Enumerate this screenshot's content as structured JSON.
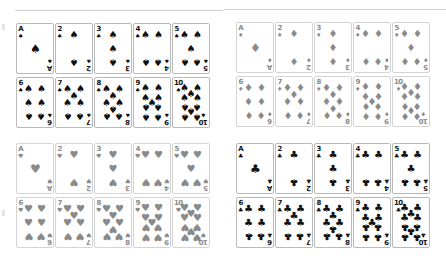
{
  "colors": {
    "black_suit": "#111111",
    "red_suit": "#8a8a8a",
    "rule": "#cfcfcf"
  },
  "suits": {
    "spades": {
      "glyph": "♠",
      "color": "black_suit",
      "icon": "spade-icon"
    },
    "diamonds": {
      "glyph": "♦",
      "color": "red_suit",
      "icon": "diamond-icon"
    },
    "hearts": {
      "glyph": "♥",
      "color": "red_suit",
      "icon": "heart-icon"
    },
    "clubs": {
      "glyph": "♣",
      "color": "black_suit",
      "icon": "club-icon"
    }
  },
  "panels": [
    {
      "name": "spades-panel",
      "suit": "spades",
      "x": 16,
      "y": 23,
      "ranks": [
        "A",
        "2",
        "3",
        "4",
        "5",
        "6",
        "7",
        "8",
        "9",
        "10"
      ]
    },
    {
      "name": "diamonds-panel",
      "suit": "diamonds",
      "x": 236,
      "y": 22,
      "ranks": [
        "A",
        "2",
        "3",
        "4",
        "5",
        "6",
        "7",
        "8",
        "9",
        "10"
      ]
    },
    {
      "name": "hearts-panel",
      "suit": "hearts",
      "x": 16,
      "y": 143,
      "ranks": [
        "A",
        "2",
        "3",
        "4",
        "5",
        "6",
        "7",
        "8",
        "9",
        "10"
      ]
    },
    {
      "name": "clubs-panel",
      "suit": "clubs",
      "x": 236,
      "y": 143,
      "ranks": [
        "A",
        "2",
        "3",
        "4",
        "5",
        "6",
        "7",
        "8",
        "9",
        "10"
      ]
    }
  ],
  "rules": [
    {
      "x": 15,
      "y": 10,
      "w": 208
    },
    {
      "x": 224,
      "y": 9,
      "w": 222
    }
  ]
}
